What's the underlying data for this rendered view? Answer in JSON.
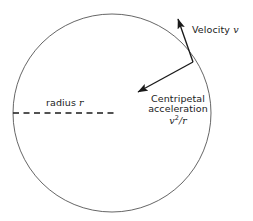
{
  "diagram": {
    "background_color": "#ffffff",
    "stroke_color": "#1a1a1a",
    "circle_stroke_color": "#555555",
    "text_color": "#1a1a1a",
    "circle": {
      "name": "circular-path",
      "center_x": 112,
      "center_y": 113,
      "radius": 99
    },
    "radius_line": {
      "name": "radius-dashed-line",
      "x1": 13,
      "y1": 113,
      "x2": 114,
      "y2": 113,
      "style": "dashed"
    },
    "velocity_arrow": {
      "name": "velocity-arrow",
      "from_x": 193,
      "from_y": 62,
      "to_x": 177,
      "to_y": 17
    },
    "acceleration_arrow": {
      "name": "centripetal-acceleration-arrow",
      "from_x": 193,
      "from_y": 62,
      "to_x": 136,
      "to_y": 93
    },
    "labels": {
      "velocity_text": "Velocity",
      "velocity_symbol": "v",
      "radius_text": "radius",
      "radius_symbol": "r",
      "centripetal_line1": "Centripetal",
      "centripetal_line2": "acceleration",
      "formula_base": "v",
      "formula_exponent": "2",
      "formula_divisor": "/r"
    }
  }
}
